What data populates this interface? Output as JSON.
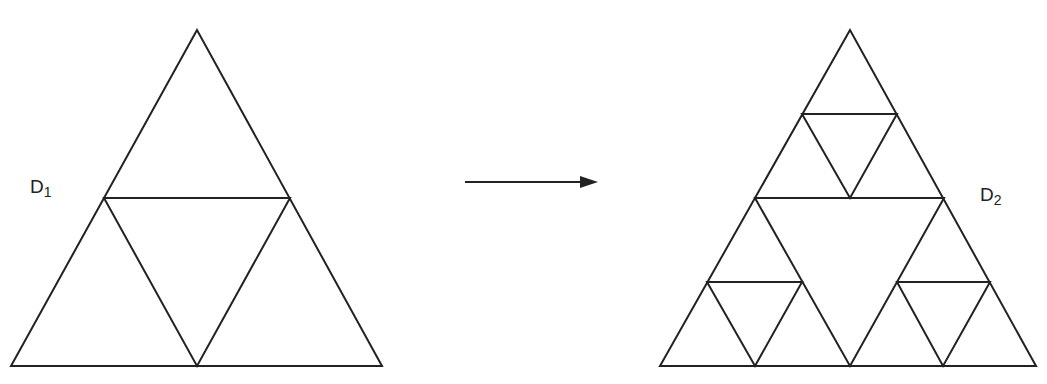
{
  "diagram": {
    "type": "sierpinski-iteration",
    "stroke_color": "#222222",
    "background": "#ffffff",
    "left": {
      "label_main": "D",
      "label_sub": "1",
      "iteration": 1
    },
    "arrow": {
      "direction": "right"
    },
    "right": {
      "label_main": "D",
      "label_sub": "2",
      "iteration": 2
    }
  }
}
